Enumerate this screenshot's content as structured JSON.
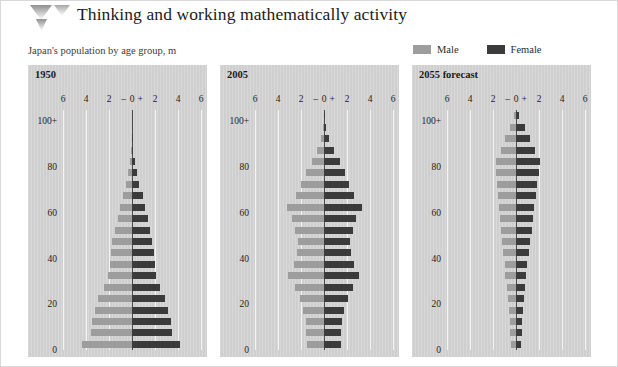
{
  "header": {
    "title": "Thinking and working mathematically activity",
    "logo_icon": "chevron-down-logo-icon"
  },
  "subtitle": "Japan's population by age group, m",
  "legend": {
    "items": [
      {
        "label": "Male",
        "color": "#9d9d9d",
        "icon": "legend-swatch-male"
      },
      {
        "label": "Female",
        "color": "#3b3b3b",
        "icon": "legend-swatch-female"
      }
    ]
  },
  "colors": {
    "male": "#9d9d9d",
    "female": "#3b3b3b",
    "panel_background": "#cfcfcf",
    "gridline": "#f4f4f4",
    "axis": "#4a4a4a",
    "page_background": "#ffffff"
  },
  "chart_data": [
    {
      "type": "bar",
      "title": "1950",
      "subtitle": "Japan's population by age group, m",
      "orientation": "horizontal",
      "style": "population-pyramid",
      "xlabel": "",
      "ylabel": "",
      "xlim": [
        -6,
        6
      ],
      "xticks": [
        -6,
        -4,
        -2,
        0,
        2,
        4,
        6
      ],
      "xticklabels": [
        "6",
        "4",
        "2",
        "–",
        "0",
        "+",
        "2",
        "4",
        "6"
      ],
      "yticks": [
        0,
        20,
        40,
        60,
        80,
        100
      ],
      "yticklabels": [
        "0",
        "20",
        "40",
        "60",
        "80",
        "100+"
      ],
      "grid": true,
      "legend": "top-right",
      "categories": [
        "0-4",
        "5-9",
        "10-14",
        "15-19",
        "20-24",
        "25-29",
        "30-34",
        "35-39",
        "40-44",
        "45-49",
        "50-54",
        "55-59",
        "60-64",
        "65-69",
        "70-74",
        "75-79",
        "80-84",
        "85-89",
        "90-94",
        "95-99",
        "100+"
      ],
      "series": [
        {
          "name": "Male",
          "values": [
            4.35,
            3.55,
            3.45,
            3.25,
            2.95,
            2.4,
            2.05,
            1.95,
            1.85,
            1.7,
            1.45,
            1.25,
            1.05,
            0.8,
            0.55,
            0.35,
            0.18,
            0.07,
            0.03,
            0.01,
            0.0
          ]
        },
        {
          "name": "Female",
          "values": [
            4.2,
            3.45,
            3.35,
            3.15,
            2.9,
            2.45,
            2.1,
            2.0,
            1.9,
            1.75,
            1.55,
            1.35,
            1.15,
            0.92,
            0.65,
            0.42,
            0.24,
            0.1,
            0.04,
            0.02,
            0.0
          ]
        }
      ]
    },
    {
      "type": "bar",
      "title": "2005",
      "orientation": "horizontal",
      "style": "population-pyramid",
      "xlim": [
        -6,
        6
      ],
      "xticks": [
        -6,
        -4,
        -2,
        0,
        2,
        4,
        6
      ],
      "xticklabels": [
        "6",
        "4",
        "2",
        "–",
        "0",
        "+",
        "2",
        "4",
        "6"
      ],
      "yticks": [
        0,
        20,
        40,
        60,
        80,
        100
      ],
      "yticklabels": [
        "0",
        "20",
        "40",
        "60",
        "80",
        "100+"
      ],
      "grid": true,
      "categories": [
        "0-4",
        "5-9",
        "10-14",
        "15-19",
        "20-24",
        "25-29",
        "30-34",
        "35-39",
        "40-44",
        "45-49",
        "50-54",
        "55-59",
        "60-64",
        "65-69",
        "70-74",
        "75-79",
        "80-84",
        "85-89",
        "90-94",
        "95-99",
        "100+"
      ],
      "series": [
        {
          "name": "Male",
          "values": [
            1.5,
            1.55,
            1.6,
            1.8,
            2.1,
            2.55,
            3.1,
            2.65,
            2.35,
            2.25,
            2.5,
            2.75,
            3.2,
            2.45,
            2.0,
            1.55,
            1.05,
            0.6,
            0.25,
            0.08,
            0.02
          ]
        },
        {
          "name": "Female",
          "values": [
            1.45,
            1.5,
            1.55,
            1.72,
            2.05,
            2.5,
            3.05,
            2.6,
            2.32,
            2.25,
            2.5,
            2.8,
            3.3,
            2.6,
            2.2,
            1.8,
            1.35,
            0.9,
            0.45,
            0.15,
            0.04
          ]
        }
      ]
    },
    {
      "type": "bar",
      "title": "2055 forecast",
      "orientation": "horizontal",
      "style": "population-pyramid",
      "xlim": [
        -6,
        6
      ],
      "xticks": [
        -6,
        -4,
        -2,
        0,
        2,
        4,
        6
      ],
      "xticklabels": [
        "6",
        "4",
        "2",
        "–",
        "0",
        "+",
        "2",
        "4",
        "6"
      ],
      "yticks": [
        0,
        20,
        40,
        60,
        80,
        100
      ],
      "yticklabels": [
        "0",
        "20",
        "40",
        "60",
        "80",
        "100+"
      ],
      "grid": true,
      "categories": [
        "0-4",
        "5-9",
        "10-14",
        "15-19",
        "20-24",
        "25-29",
        "30-34",
        "35-39",
        "40-44",
        "45-49",
        "50-54",
        "55-59",
        "60-64",
        "65-69",
        "70-74",
        "75-79",
        "80-84",
        "85-89",
        "90-94",
        "95-99",
        "100+"
      ],
      "series": [
        {
          "name": "Male",
          "values": [
            0.45,
            0.5,
            0.55,
            0.62,
            0.7,
            0.8,
            0.92,
            1.0,
            1.15,
            1.22,
            1.3,
            1.42,
            1.5,
            1.55,
            1.62,
            1.72,
            1.75,
            1.3,
            0.95,
            0.55,
            0.2
          ]
        },
        {
          "name": "Female",
          "values": [
            0.42,
            0.48,
            0.53,
            0.6,
            0.68,
            0.78,
            0.9,
            0.98,
            1.12,
            1.25,
            1.35,
            1.48,
            1.58,
            1.7,
            1.82,
            1.98,
            2.05,
            1.62,
            1.25,
            0.78,
            0.3
          ]
        }
      ]
    }
  ]
}
